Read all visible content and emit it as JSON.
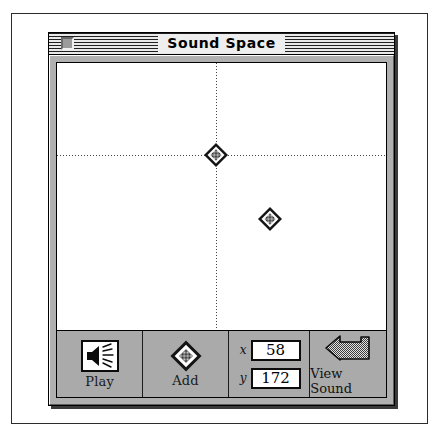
{
  "window": {
    "title": "Sound Space",
    "close_box": "close-box"
  },
  "canvas": {
    "crosshair": {
      "x_pct": 48.3,
      "y_pct": 34.5
    },
    "markers": [
      {
        "name": "sound-point-selected",
        "x_pct": 48.3,
        "y_pct": 34.5
      },
      {
        "name": "sound-point",
        "x_pct": 64.6,
        "y_pct": 58.5
      }
    ]
  },
  "toolbar": {
    "play": {
      "label": "Play",
      "icon": "speaker-icon"
    },
    "add": {
      "label": "Add",
      "icon": "diamond-icon"
    },
    "coords": {
      "x_axis_label": "x",
      "x_value": "58",
      "y_axis_label": "y",
      "y_value": "172"
    },
    "view_sound": {
      "label": "View Sound",
      "icon": "back-arrow-icon"
    }
  },
  "colors": {
    "window_face": "#b0b0b0",
    "toolbar_face": "#aaaaaa",
    "canvas": "#ffffff",
    "ink": "#000000"
  }
}
